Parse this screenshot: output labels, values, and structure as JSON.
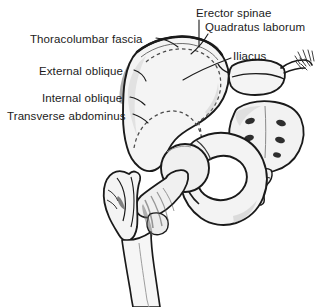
{
  "figure": {
    "background_color": "#ffffff",
    "label_color": "#1b1b1b",
    "bone_fill": "#f2f2f2",
    "outline_color": "#1a1a1a",
    "shading_color": "#9a9a9a",
    "dashed_color": "#555555",
    "width": 323,
    "height": 307
  },
  "labels": {
    "left": [
      {
        "id": "thoracolumbar-fascia",
        "text": "Thoracolumbar fascia"
      },
      {
        "id": "external-oblique",
        "text": "External oblique"
      },
      {
        "id": "internal-oblique",
        "text": "Internal oblique"
      },
      {
        "id": "transverse-abdominus",
        "text": "Transverse abdominus"
      }
    ],
    "right": [
      {
        "id": "erector-spinae",
        "text": "Erector spinae"
      },
      {
        "id": "quadratus-laborum",
        "text": "Quadratus laborum"
      },
      {
        "id": "iliacus",
        "text": "Iliacus"
      }
    ]
  },
  "structures": [
    {
      "id": "ilium",
      "name": "ilium-iliac-blade"
    },
    {
      "id": "iliac-crest",
      "name": "iliac-crest"
    },
    {
      "id": "iliac-fossa",
      "name": "iliac-fossa-dashed-outline"
    },
    {
      "id": "sacrum",
      "name": "sacrum-with-foramina"
    },
    {
      "id": "coccyx",
      "name": "coccyx"
    },
    {
      "id": "lumbar-vertebra",
      "name": "lumbar-vertebra-l5"
    },
    {
      "id": "acetabulum",
      "name": "acetabulum"
    },
    {
      "id": "femoral-head",
      "name": "femoral-head"
    },
    {
      "id": "femoral-neck",
      "name": "femoral-neck"
    },
    {
      "id": "greater-trochanter",
      "name": "greater-trochanter"
    },
    {
      "id": "lesser-trochanter",
      "name": "lesser-trochanter"
    },
    {
      "id": "femoral-shaft",
      "name": "femoral-shaft"
    },
    {
      "id": "obturator-foramen",
      "name": "obturator-foramen"
    },
    {
      "id": "pubic-ramus",
      "name": "pubic-ramus"
    },
    {
      "id": "ischium",
      "name": "ischium"
    }
  ]
}
